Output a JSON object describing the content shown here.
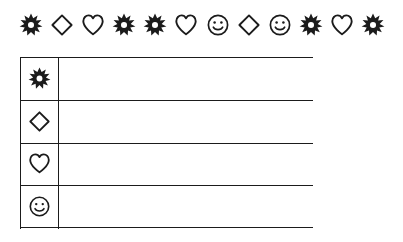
{
  "worksheet": {
    "background_color": "#ffffff",
    "ink_color": "#1b1b1b",
    "sequence_label": "",
    "sequence": [
      {
        "icon": "star-icon",
        "glyph": "star"
      },
      {
        "icon": "diamond-icon",
        "glyph": "diamond"
      },
      {
        "icon": "heart-icon",
        "glyph": "heart"
      },
      {
        "icon": "star-icon",
        "glyph": "star"
      },
      {
        "icon": "star-icon",
        "glyph": "star"
      },
      {
        "icon": "heart-icon",
        "glyph": "heart"
      },
      {
        "icon": "smiley-icon",
        "glyph": "smiley"
      },
      {
        "icon": "diamond-icon",
        "glyph": "diamond"
      },
      {
        "icon": "smiley-icon",
        "glyph": "smiley"
      },
      {
        "icon": "star-icon",
        "glyph": "star"
      },
      {
        "icon": "heart-icon",
        "glyph": "heart"
      },
      {
        "icon": "star-icon",
        "glyph": "star"
      }
    ],
    "sequence_count": 12,
    "table": {
      "columns": [
        "",
        ""
      ],
      "rows": [
        {
          "key_icon": "star-icon",
          "key_glyph": "star",
          "value": ""
        },
        {
          "key_icon": "diamond-icon",
          "key_glyph": "diamond",
          "value": ""
        },
        {
          "key_icon": "heart-icon",
          "key_glyph": "heart",
          "value": ""
        },
        {
          "key_icon": "smiley-icon",
          "key_glyph": "smiley",
          "value": ""
        }
      ]
    },
    "counts_in_sequence": {
      "star": 5,
      "diamond": 2,
      "heart": 3,
      "smiley": 2
    }
  }
}
